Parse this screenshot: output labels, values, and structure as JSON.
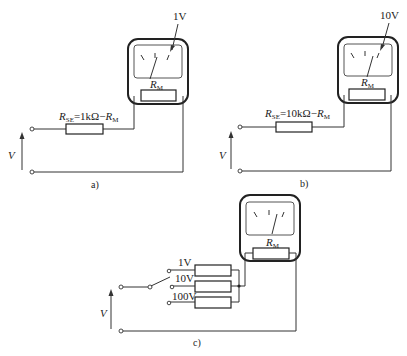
{
  "figure": {
    "panels": [
      {
        "id": "a",
        "caption": "a)",
        "range_label": "1V",
        "series_resistor_label": {
          "symbol": "R",
          "subscript": "SE",
          "expr": "=1kΩ−",
          "rm_symbol": "R",
          "rm_subscript": "M"
        },
        "meter_resistor_label": {
          "symbol": "R",
          "subscript": "M"
        },
        "voltage_label": "V"
      },
      {
        "id": "b",
        "caption": "b)",
        "range_label": "10V",
        "series_resistor_label": {
          "symbol": "R",
          "subscript": "SE",
          "expr": "=10kΩ−",
          "rm_symbol": "R",
          "rm_subscript": "M"
        },
        "meter_resistor_label": {
          "symbol": "R",
          "subscript": "M"
        },
        "voltage_label": "V"
      },
      {
        "id": "c",
        "caption": "c)",
        "range_labels": [
          "1V",
          "10V",
          "100V"
        ],
        "meter_resistor_label": {
          "symbol": "R",
          "subscript": "M"
        },
        "voltage_label": "V"
      }
    ],
    "colors": {
      "line": "#333333",
      "background": "#ffffff"
    }
  }
}
